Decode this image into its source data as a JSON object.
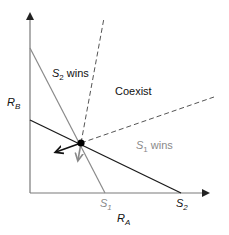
{
  "axes": {
    "x_label_main": "R",
    "x_label_sub": "A",
    "y_label_main": "R",
    "y_label_sub": "B"
  },
  "regions": {
    "s2_wins": {
      "s": "S",
      "sub": "2",
      "text": " wins"
    },
    "coexist": "Coexist",
    "s1_wins": {
      "s": "S",
      "sub": "1",
      "text": " wins"
    }
  },
  "intercepts": {
    "s1": {
      "s": "S",
      "sub": "1"
    },
    "s2": {
      "s": "S",
      "sub": "2"
    }
  },
  "colors": {
    "black_line": "#1a1a1a",
    "gray_line": "#8a8a8a",
    "axis": "#7a7a7a",
    "dashed": "#555555",
    "s1_text": "#8a8a8a"
  }
}
